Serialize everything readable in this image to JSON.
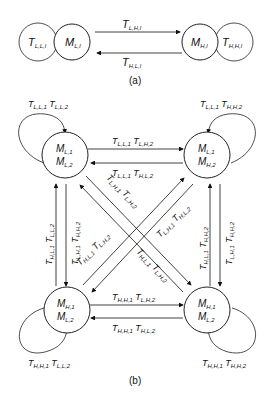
{
  "figure_a": {
    "caption": "(a)",
    "nodes": [
      {
        "id": "ML",
        "label": "M",
        "sub": "L,l"
      },
      {
        "id": "MH",
        "label": "M",
        "sub": "H,l"
      }
    ],
    "self_loops": [
      {
        "node": "ML",
        "label": "T",
        "sub": "L,L,l"
      },
      {
        "node": "MH",
        "label": "T",
        "sub": "H,H,l"
      }
    ],
    "edges": [
      {
        "from": "ML",
        "to": "MH",
        "label": "T",
        "sub": "L,H,l"
      },
      {
        "from": "MH",
        "to": "ML",
        "label": "T",
        "sub": "H,L,l"
      }
    ]
  },
  "figure_b": {
    "caption": "(b)",
    "nodes": [
      {
        "id": "TL",
        "line1": "M",
        "sub1": "L,1",
        "line2": "M",
        "sub2": "L,2"
      },
      {
        "id": "TR",
        "line1": "M",
        "sub1": "L,1",
        "line2": "M",
        "sub2": "H,2"
      },
      {
        "id": "BL",
        "line1": "M",
        "sub1": "H,1",
        "line2": "M",
        "sub2": "L,2"
      },
      {
        "id": "BR",
        "line1": "M",
        "sub1": "H,1",
        "line2": "M",
        "sub2": "L,2"
      }
    ],
    "self_loops": [
      {
        "node": "TL",
        "a": "L,L,1",
        "b": "L,L,2"
      },
      {
        "node": "TR",
        "a": "L,L,1",
        "b": "H,H,2"
      },
      {
        "node": "BL",
        "a": "H,H,1",
        "b": "L,L,2"
      },
      {
        "node": "BR",
        "a": "H,H,1",
        "b": "H,H,2"
      }
    ],
    "edges": [
      {
        "from": "TL",
        "to": "TR",
        "a": "L,L,1",
        "b": "L,H,2"
      },
      {
        "from": "TR",
        "to": "TL",
        "a": "L,L,1",
        "b": "H,L,2"
      },
      {
        "from": "BL",
        "to": "BR",
        "a": "H,H,1",
        "b": "L,H,2"
      },
      {
        "from": "BR",
        "to": "BL",
        "a": "H,H,1",
        "b": "H,L,2"
      },
      {
        "from": "BL",
        "to": "TL",
        "a": "H,L,1",
        "b": "L,L,2"
      },
      {
        "from": "TL",
        "to": "BL",
        "a": "L,H,1",
        "b": "H,H,2"
      },
      {
        "from": "BR",
        "to": "TR",
        "a": "H,L,1",
        "b": "H,H,2"
      },
      {
        "from": "TR",
        "to": "BR",
        "a": "L,H,1",
        "b": "H,H,2"
      },
      {
        "from": "TL",
        "to": "BR",
        "a": "L,H,1",
        "b": "L,H,2"
      },
      {
        "from": "BR",
        "to": "TL",
        "a": "H,L,1",
        "b": "L,H,2"
      },
      {
        "from": "BL",
        "to": "TR",
        "a": "H,L,1",
        "b": "L,H,2"
      },
      {
        "from": "TR",
        "to": "BL",
        "a": "L,H,1",
        "b": "H,L,2"
      }
    ]
  }
}
